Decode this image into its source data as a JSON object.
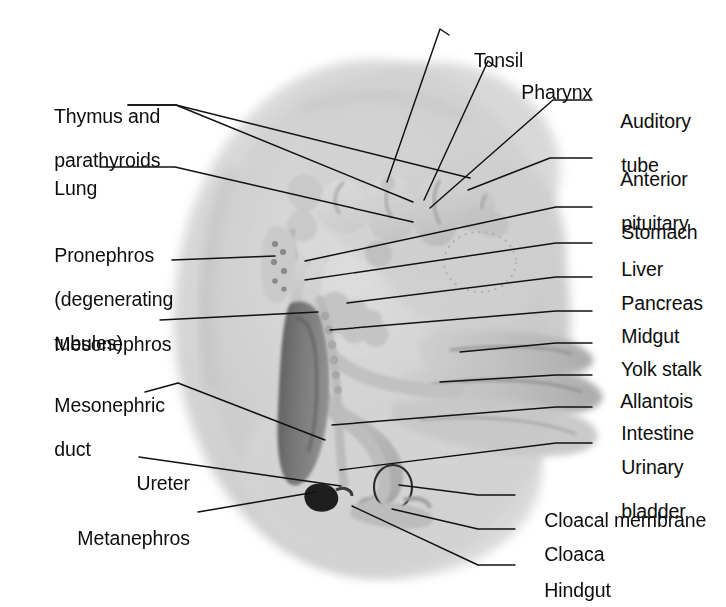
{
  "figure": {
    "style": "grayscale-airbrush-illustration",
    "colors": {
      "background": "#ffffff",
      "body_outer": "#d9d9d9",
      "body_inner": "#cbcbcb",
      "gut_tube": "#c2c2c2",
      "gut_tube_shade": "#a8a8a8",
      "mesonephros_dark": "#6a6a6a",
      "metanephros_black": "#1a1a1a",
      "leader_line": "#111111",
      "text": "#0d0d0d"
    }
  },
  "labels_left": [
    {
      "id": "thymus-and-parathyroids",
      "lines": [
        "Thymus and",
        "parathyroids"
      ],
      "align": "left",
      "x": 33,
      "y": 83
    },
    {
      "id": "lung",
      "lines": [
        "Lung"
      ],
      "align": "left",
      "x": 33,
      "y": 155
    },
    {
      "id": "pronephros",
      "lines": [
        "Pronephros",
        "(degenerating",
        "tubules)"
      ],
      "align": "left",
      "x": 33,
      "y": 222
    },
    {
      "id": "mesonephros",
      "lines": [
        "Mesonephros"
      ],
      "align": "left",
      "x": 33,
      "y": 311
    },
    {
      "id": "mesonephric-duct",
      "lines": [
        "Mesonephric",
        "duct"
      ],
      "align": "left",
      "x": 33,
      "y": 372
    },
    {
      "id": "ureter",
      "lines": [
        "Ureter"
      ],
      "align": "right",
      "x": 68,
      "y": 450
    },
    {
      "id": "metanephros",
      "lines": [
        "Metanephros"
      ],
      "align": "right",
      "x": 68,
      "y": 505
    }
  ],
  "labels_right": [
    {
      "id": "tonsil",
      "lines": [
        "Tonsil"
      ],
      "x": 453,
      "y": 27
    },
    {
      "id": "pharynx",
      "lines": [
        "Pharynx"
      ],
      "x": 500,
      "y": 59
    },
    {
      "id": "auditory-tube",
      "lines": [
        "Auditory",
        "tube"
      ],
      "x": 600,
      "y": 88
    },
    {
      "id": "anterior-pituitary",
      "lines": [
        "Anterior",
        "pituitary"
      ],
      "x": 600,
      "y": 146
    },
    {
      "id": "stomach",
      "lines": [
        "Stomach"
      ],
      "x": 600,
      "y": 199
    },
    {
      "id": "liver",
      "lines": [
        "Liver"
      ],
      "x": 600,
      "y": 236
    },
    {
      "id": "pancreas",
      "lines": [
        "Pancreas"
      ],
      "x": 600,
      "y": 270
    },
    {
      "id": "midgut",
      "lines": [
        "Midgut"
      ],
      "x": 600,
      "y": 303
    },
    {
      "id": "yolk-stalk",
      "lines": [
        "Yolk stalk"
      ],
      "x": 600,
      "y": 336
    },
    {
      "id": "allantois",
      "lines": [
        "Allantois"
      ],
      "x": 600,
      "y": 368
    },
    {
      "id": "intestine",
      "lines": [
        "Intestine"
      ],
      "x": 600,
      "y": 400
    },
    {
      "id": "urinary-bladder",
      "lines": [
        "Urinary",
        "bladder"
      ],
      "x": 600,
      "y": 434
    },
    {
      "id": "cloacal-membrane",
      "lines": [
        "Cloacal membrane"
      ],
      "x": 523,
      "y": 487
    },
    {
      "id": "cloaca",
      "lines": [
        "Cloaca"
      ],
      "x": 523,
      "y": 521
    },
    {
      "id": "hindgut",
      "lines": [
        "Hindgut"
      ],
      "x": 523,
      "y": 557
    }
  ],
  "leader_lines": [
    {
      "id": "leader-thymus-a",
      "points": "128,105 176,105 413,202"
    },
    {
      "id": "leader-parathyroids-b",
      "points": "128,105 176,105 470,178"
    },
    {
      "id": "leader-lung",
      "points": "100,167 175,167 413,222"
    },
    {
      "id": "leader-pronephros",
      "points": "172,260 275,256"
    },
    {
      "id": "leader-mesonephros",
      "points": "160,320 318,312"
    },
    {
      "id": "leader-mesonephric-duct",
      "points": "145,392 178,383 325,440"
    },
    {
      "id": "leader-ureter",
      "points": "139,457 341,486"
    },
    {
      "id": "leader-metanephros",
      "points": "198,512 316,492"
    },
    {
      "id": "leader-tonsil",
      "points": "449,35 440,29 387,182"
    },
    {
      "id": "leader-pharynx",
      "points": "496,67 488,61 424,200"
    },
    {
      "id": "leader-auditory-tube",
      "points": "592,100 553,100 430,208"
    },
    {
      "id": "leader-anterior-pituitary",
      "points": "592,158 550,158 468,190"
    },
    {
      "id": "leader-stomach",
      "points": "592,207 556,207 305,261"
    },
    {
      "id": "leader-liver",
      "points": "592,243 556,243 305,280"
    },
    {
      "id": "leader-pancreas",
      "points": "592,277 556,277 347,303"
    },
    {
      "id": "leader-midgut",
      "points": "592,311 556,311 330,330"
    },
    {
      "id": "leader-yolk-stalk",
      "points": "592,343 556,343 460,352"
    },
    {
      "id": "leader-allantois",
      "points": "592,375 556,375 440,382"
    },
    {
      "id": "leader-intestine",
      "points": "592,407 556,407 332,425"
    },
    {
      "id": "leader-urinary-bladder",
      "points": "592,443 556,443 340,470"
    },
    {
      "id": "leader-cloacal-membrane",
      "points": "515,495 478,495 399,485"
    },
    {
      "id": "leader-cloaca",
      "points": "515,529 478,529 392,509"
    },
    {
      "id": "leader-hindgut",
      "points": "515,565 478,565 352,506"
    }
  ]
}
